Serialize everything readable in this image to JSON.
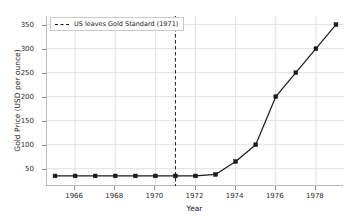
{
  "chart_data": {
    "type": "line",
    "title": "",
    "xlabel": "Year",
    "ylabel": "Gold Price (USD per ounce)",
    "xlim": [
      1964.6,
      1979.4
    ],
    "ylim": [
      14,
      368
    ],
    "grid": true,
    "legend_position": "upper left",
    "x": [
      1965,
      1966,
      1967,
      1968,
      1969,
      1970,
      1971,
      1972,
      1973,
      1974,
      1975,
      1976,
      1977,
      1978,
      1979
    ],
    "series": [
      {
        "name": "Gold Price",
        "values": [
          35,
          35,
          35,
          35,
          35,
          35,
          35,
          35,
          38,
          65,
          100,
          200,
          250,
          300,
          350
        ],
        "color": "#1a1a1a",
        "marker": "square"
      }
    ],
    "xticks": [
      1966,
      1968,
      1970,
      1972,
      1974,
      1976,
      1978
    ],
    "xtick_labels": [
      "1966",
      "1968",
      "1970",
      "1972",
      "1974",
      "1976",
      "1978"
    ],
    "yticks": [
      50,
      100,
      150,
      200,
      250,
      300,
      350
    ],
    "ytick_labels": [
      "50",
      "100",
      "150",
      "200",
      "250",
      "300",
      "350"
    ],
    "annotations": [
      {
        "type": "vline",
        "x": 1971,
        "label": "US leaves Gold Standard (1971)",
        "style": "dashed",
        "color": "#1a1a1a"
      }
    ],
    "legend": [
      {
        "label": "US leaves Gold Standard (1971)",
        "style": "dashed",
        "color": "#1a1a1a"
      }
    ],
    "colors": {
      "line": "#1a1a1a",
      "grid": "#d9d9d9",
      "axis": "#b8b8b8",
      "background": "#ffffff",
      "text": "#1a1a1a"
    }
  }
}
